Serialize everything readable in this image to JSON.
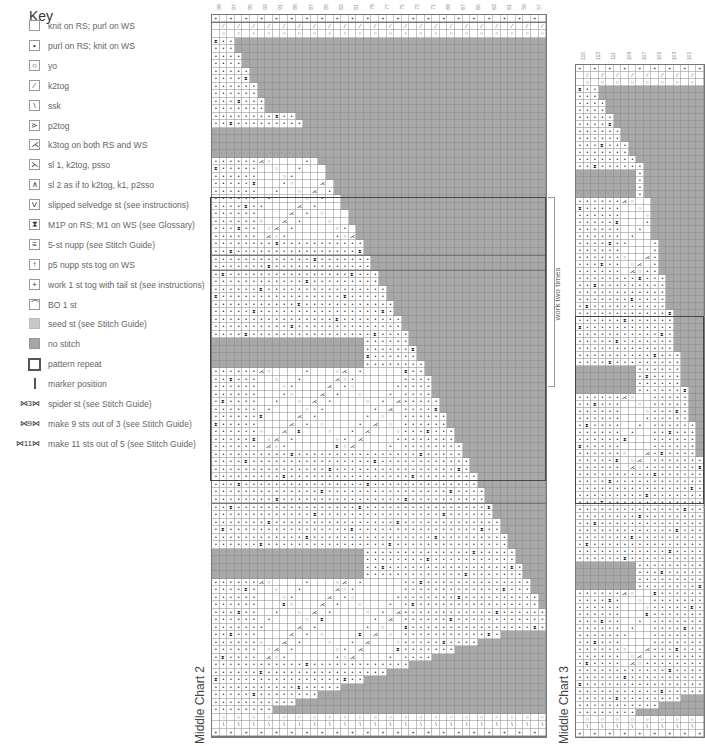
{
  "key": {
    "title": "Key",
    "items": [
      {
        "symbol": "",
        "style": "",
        "label": "knit on RS; purl on WS",
        "icon": "knit-icon"
      },
      {
        "symbol": "•",
        "style": "",
        "label": "purl on RS; knit on WS",
        "icon": "purl-icon"
      },
      {
        "symbol": "○",
        "style": "",
        "label": "yo",
        "icon": "yarnover-icon"
      },
      {
        "symbol": "⁄",
        "style": "",
        "label": "k2tog",
        "icon": "k2tog-icon"
      },
      {
        "symbol": "\\",
        "style": "",
        "label": "ssk",
        "icon": "ssk-icon"
      },
      {
        "symbol": "⋗",
        "style": "",
        "label": "p2tog",
        "icon": "p2tog-icon"
      },
      {
        "symbol": "⋌",
        "style": "",
        "label": "k3tog on both RS and WS",
        "icon": "k3tog-icon"
      },
      {
        "symbol": "⋋",
        "style": "",
        "label": "sl 1, k2tog, psso",
        "icon": "sl1-k2tog-psso-icon"
      },
      {
        "symbol": "∧",
        "style": "",
        "label": "sl 2 as if to k2tog, k1, p2sso",
        "icon": "centered-double-decrease-icon"
      },
      {
        "symbol": "V",
        "style": "",
        "label": "slipped selvedge st (see instructions)",
        "icon": "slipped-selvedge-icon"
      },
      {
        "symbol": "⧗",
        "style": "",
        "label": "M1P on RS; M1 on WS (see Glossary)",
        "icon": "m1p-icon"
      },
      {
        "symbol": "≡",
        "style": "",
        "label": "5-st nupp (see Stitch Guide)",
        "icon": "nupp-icon"
      },
      {
        "symbol": "↑",
        "style": "",
        "label": "p5 nupp sts tog on WS",
        "icon": "p5-nupp-tog-icon"
      },
      {
        "symbol": "+",
        "style": "",
        "label": "work 1 st tog with tail st (see instructions)",
        "icon": "tail-st-icon"
      },
      {
        "symbol": "⌒",
        "style": "",
        "label": "BO 1 st",
        "icon": "bind-off-icon"
      },
      {
        "symbol": "",
        "style": "seed",
        "label": "seed st (see Stitch Guide)",
        "icon": "seed-stitch-icon"
      },
      {
        "symbol": "",
        "style": "nostitch",
        "label": "no stitch",
        "icon": "no-stitch-icon"
      },
      {
        "symbol": "",
        "style": "repeat",
        "label": "pattern repeat",
        "icon": "pattern-repeat-icon"
      },
      {
        "symbol": "",
        "style": "marker",
        "label": "marker position",
        "icon": "marker-icon"
      },
      {
        "symbol": "⋈3⋈",
        "style": "wide",
        "label": "spider st (see Stitch Guide)",
        "icon": "spider-stitch-icon"
      },
      {
        "symbol": "⋈9⋈",
        "style": "wide",
        "label": "make 9 sts out of 3 (see Stitch Guide)",
        "icon": "make-9-from-3-icon"
      },
      {
        "symbol": "⋈11⋈",
        "style": "wide",
        "label": "make 11 sts out of 5 (see Stitch Guide)",
        "icon": "make-11-from-5-icon"
      }
    ]
  },
  "charts": [
    {
      "id": "middle-chart-2",
      "title": "Middle Chart 2",
      "columns": 44,
      "col_numbers": [
        "99",
        "97",
        "95",
        "93",
        "91",
        "89",
        "87",
        "85",
        "83",
        "81",
        "79",
        "77",
        "75",
        "73",
        "71",
        "69",
        "67",
        "65",
        "63",
        "61",
        "59",
        "57"
      ],
      "repeat_label": "work two times",
      "rows": 96
    },
    {
      "id": "middle-chart-3",
      "title": "Middle Chart 3",
      "columns": 17,
      "col_numbers": [
        "115",
        "113",
        "111",
        "109",
        "107",
        "105",
        "103",
        "101"
      ],
      "repeat_label": "work three times",
      "rows": 96
    }
  ],
  "page_number": "8"
}
